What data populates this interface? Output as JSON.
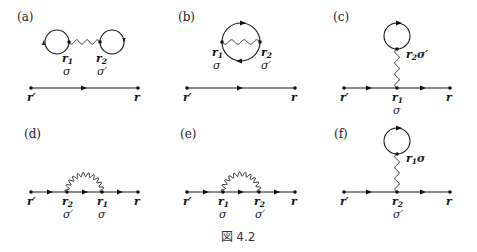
{
  "figure": {
    "caption": "図 4.2",
    "panels": [
      {
        "id": "a",
        "label": "(a)",
        "description": "two closed loops joined by interaction line, disconnected from propagator",
        "vertices": [
          {
            "vec": "r",
            "sub": "1",
            "spin": "σ"
          },
          {
            "vec": "r",
            "sub": "2",
            "spin": "σ′"
          }
        ],
        "endpoints": {
          "start": "r′",
          "end": "r"
        }
      },
      {
        "id": "b",
        "label": "(b)",
        "description": "single loop with internal interaction line, disconnected from propagator",
        "vertices": [
          {
            "vec": "r",
            "sub": "1",
            "spin": "σ"
          },
          {
            "vec": "r",
            "sub": "2",
            "spin": "σ′"
          }
        ],
        "endpoints": {
          "start": "r′",
          "end": "r"
        }
      },
      {
        "id": "c",
        "label": "(c)",
        "description": "tadpole (Hartree) diagram",
        "vertices": [
          {
            "vec": "r",
            "sub": "2",
            "spin": "σ′",
            "position": "loop"
          },
          {
            "vec": "r",
            "sub": "1",
            "spin": "σ",
            "position": "line"
          }
        ],
        "endpoints": {
          "start": "r′",
          "end": "r"
        }
      },
      {
        "id": "d",
        "label": "(d)",
        "description": "exchange (Fock) diagram",
        "vertices": [
          {
            "vec": "r",
            "sub": "2",
            "spin": "σ′"
          },
          {
            "vec": "r",
            "sub": "1",
            "spin": "σ"
          }
        ],
        "endpoints": {
          "start": "r′",
          "end": "r"
        }
      },
      {
        "id": "e",
        "label": "(e)",
        "description": "exchange (Fock) diagram",
        "vertices": [
          {
            "vec": "r",
            "sub": "1",
            "spin": "σ"
          },
          {
            "vec": "r",
            "sub": "2",
            "spin": "σ′"
          }
        ],
        "endpoints": {
          "start": "r′",
          "end": "r"
        }
      },
      {
        "id": "f",
        "label": "(f)",
        "description": "tadpole (Hartree) diagram",
        "vertices": [
          {
            "vec": "r",
            "sub": "1",
            "spin": "σ",
            "position": "loop"
          },
          {
            "vec": "r",
            "sub": "2",
            "spin": "σ′",
            "position": "line"
          }
        ],
        "endpoints": {
          "start": "r′",
          "end": "r"
        }
      }
    ]
  }
}
